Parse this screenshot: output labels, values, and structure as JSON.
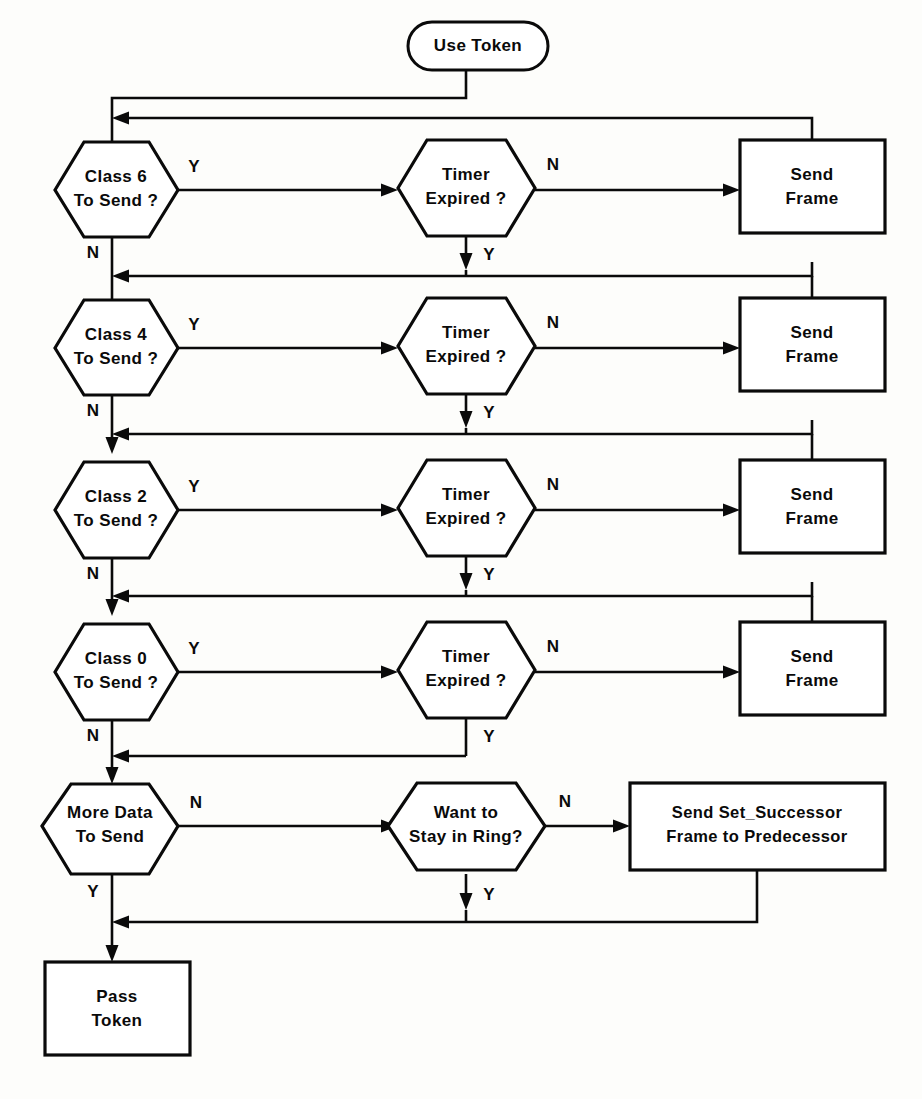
{
  "diagram": {
    "background_color": "#fdfdfb",
    "ink_color": "#0a0a0a",
    "width": 922,
    "height": 1099
  },
  "nodes": {
    "start": {
      "label": "Use Token",
      "shape": "capsule"
    },
    "class6": {
      "line1": "Class 6",
      "line2": "To Send ?",
      "shape": "hexagon"
    },
    "class4": {
      "line1": "Class 4",
      "line2": "To Send ?",
      "shape": "hexagon"
    },
    "class2": {
      "line1": "Class 2",
      "line2": "To Send ?",
      "shape": "hexagon"
    },
    "class0": {
      "line1": "Class 0",
      "line2": "To Send ?",
      "shape": "hexagon"
    },
    "timer1": {
      "line1": "Timer",
      "line2": "Expired ?",
      "shape": "hexagon"
    },
    "timer2": {
      "line1": "Timer",
      "line2": "Expired ?",
      "shape": "hexagon"
    },
    "timer3": {
      "line1": "Timer",
      "line2": "Expired ?",
      "shape": "hexagon"
    },
    "timer4": {
      "line1": "Timer",
      "line2": "Expired ?",
      "shape": "hexagon"
    },
    "send1": {
      "line1": "Send",
      "line2": "Frame",
      "shape": "rect"
    },
    "send2": {
      "line1": "Send",
      "line2": "Frame",
      "shape": "rect"
    },
    "send3": {
      "line1": "Send",
      "line2": "Frame",
      "shape": "rect"
    },
    "send4": {
      "line1": "Send",
      "line2": "Frame",
      "shape": "rect"
    },
    "moredata": {
      "line1": "More Data",
      "line2": "To Send",
      "shape": "hexagon"
    },
    "stayring": {
      "line1": "Want to",
      "line2": "Stay in Ring?",
      "shape": "hexagon"
    },
    "setsucc": {
      "line1": "Send  Set_Successor",
      "line2": "Frame to Predecessor",
      "shape": "rect"
    },
    "passtoken": {
      "line1": "Pass",
      "line2": "Token",
      "shape": "rect"
    }
  },
  "edge_labels": {
    "class6_yes": "Y",
    "class6_no": "N",
    "class4_yes": "Y",
    "class4_no": "N",
    "class2_yes": "Y",
    "class2_no": "N",
    "class0_yes": "Y",
    "class0_no": "N",
    "timer1_no": "N",
    "timer1_yes": "Y",
    "timer2_no": "N",
    "timer2_yes": "Y",
    "timer3_no": "N",
    "timer3_yes": "Y",
    "timer4_no": "N",
    "timer4_yes": "Y",
    "moredata_no": "N",
    "moredata_yes": "Y",
    "stayring_no": "N",
    "stayring_yes": "Y"
  }
}
